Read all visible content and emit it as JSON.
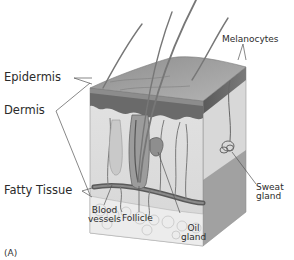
{
  "figure": {
    "panel_label": "(A)",
    "colors": {
      "text": "#2b2b2b",
      "leader_line": "#555555",
      "epidermis_top": "#9a9a9a",
      "epidermis_dark": "#5f5f5f",
      "dermis": "#e6e6e6",
      "fatty_tissue": "#efefef",
      "hair": "#7a7a7a"
    }
  },
  "labels": {
    "epidermis": "Epidermis",
    "dermis": "Dermis",
    "fatty_tissue": "Fatty Tissue",
    "melanocytes": "Melanocytes",
    "blood_vessels_line1": "Blood",
    "blood_vessels_line2": "vessels",
    "follicle": "Follicle",
    "oil_gland_line1": "Oil",
    "oil_gland_line2": "gland",
    "sweat_gland_line1": "Sweat",
    "sweat_gland_line2": "gland"
  }
}
